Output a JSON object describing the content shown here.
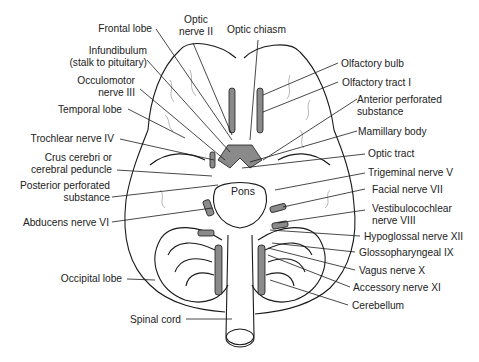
{
  "diagram": {
    "labels_left": [
      {
        "id": "frontal-lobe",
        "lines": [
          "Frontal lobe"
        ]
      },
      {
        "id": "infundibulum",
        "lines": [
          "Infundibulum",
          "(stalk to pituitary)"
        ]
      },
      {
        "id": "occulomotor",
        "lines": [
          "Occulomotor",
          "nerve III"
        ]
      },
      {
        "id": "temporal-lobe",
        "lines": [
          "Temporal lobe"
        ]
      },
      {
        "id": "trochlear",
        "lines": [
          "Trochlear nerve IV"
        ]
      },
      {
        "id": "crus-cerebri",
        "lines": [
          "Crus cerebri or",
          "cerebral peduncle"
        ]
      },
      {
        "id": "posterior-perforated",
        "lines": [
          "Posterior perforated",
          "substance"
        ]
      },
      {
        "id": "abducens",
        "lines": [
          "Abducens nerve VI"
        ]
      },
      {
        "id": "occipital-lobe",
        "lines": [
          "Occipital lobe"
        ]
      },
      {
        "id": "spinal-cord",
        "lines": [
          "Spinal cord"
        ]
      }
    ],
    "labels_top": [
      {
        "id": "optic-nerve",
        "lines": [
          "Optic",
          "nerve II"
        ]
      },
      {
        "id": "optic-chiasm",
        "lines": [
          "Optic chiasm"
        ]
      }
    ],
    "labels_right": [
      {
        "id": "olfactory-bulb",
        "lines": [
          "Olfactory bulb"
        ]
      },
      {
        "id": "olfactory-tract",
        "lines": [
          "Olfactory tract I"
        ]
      },
      {
        "id": "anterior-perforated",
        "lines": [
          "Anterior perforated",
          "substance"
        ]
      },
      {
        "id": "mamillary-body",
        "lines": [
          "Mamillary body"
        ]
      },
      {
        "id": "optic-tract",
        "lines": [
          "Optic tract"
        ]
      },
      {
        "id": "trigeminal",
        "lines": [
          "Trigeminal nerve V"
        ]
      },
      {
        "id": "facial",
        "lines": [
          "Facial nerve VII"
        ]
      },
      {
        "id": "vestibulocochlear",
        "lines": [
          "Vestibulocochlear",
          "nerve VIII"
        ]
      },
      {
        "id": "hypoglossal",
        "lines": [
          "Hypoglossal nerve XII"
        ]
      },
      {
        "id": "glossopharyngeal",
        "lines": [
          "Glossopharyngeal IX"
        ]
      },
      {
        "id": "vagus",
        "lines": [
          "Vagus nerve X"
        ]
      },
      {
        "id": "accessory",
        "lines": [
          "Accessory nerve XI"
        ]
      },
      {
        "id": "cerebellum",
        "lines": [
          "Cerebellum"
        ]
      }
    ],
    "center_label": "Pons",
    "colors": {
      "outline": "#1a1a1a",
      "nerve_fill": "#8a8a8a",
      "background": "#ffffff",
      "text": "#222222"
    }
  }
}
